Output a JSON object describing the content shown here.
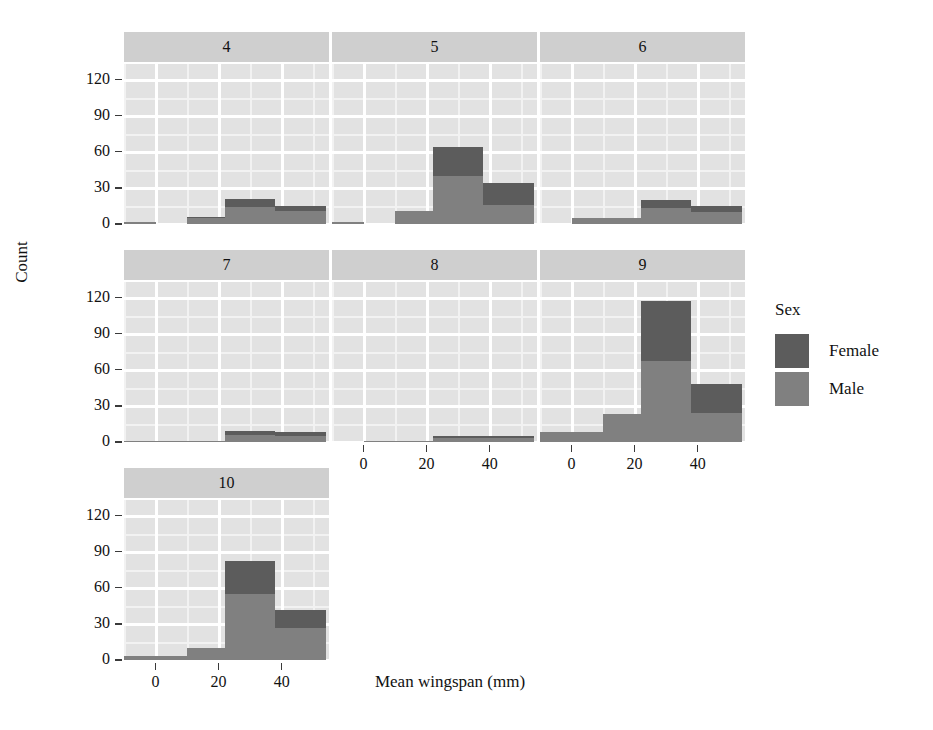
{
  "chart_data": {
    "type": "bar",
    "subtype": "stacked-histogram-facets",
    "title": "",
    "xlabel": "Mean wingspan (mm)",
    "ylabel": "Count",
    "xlim": [
      -10,
      55
    ],
    "ylim": [
      0,
      133
    ],
    "xticks": [
      0,
      20,
      40
    ],
    "yticks": [
      0,
      30,
      60,
      90,
      120
    ],
    "grid": true,
    "legend": {
      "title": "Sex",
      "position": "right",
      "entries": [
        {
          "name": "Female",
          "color": "#5c5c5c"
        },
        {
          "name": "Male",
          "color": "#808080"
        }
      ]
    },
    "facet_variable": "",
    "bin_edges": [
      -10,
      0,
      10,
      22,
      38,
      54
    ],
    "bin_centers": [
      -5,
      5,
      16,
      30,
      46
    ],
    "series": [
      {
        "name": "Female",
        "color": "#5c5c5c"
      },
      {
        "name": "Male",
        "color": "#808080"
      }
    ],
    "facets": [
      {
        "label": "4",
        "row": 0,
        "col": 0,
        "bins": [
          {
            "x0": -10,
            "x1": 0,
            "male": 2,
            "female": 0,
            "total": 2
          },
          {
            "x0": 0,
            "x1": 10,
            "male": 0,
            "female": 0,
            "total": 0
          },
          {
            "x0": 10,
            "x1": 22,
            "male": 5,
            "female": 1,
            "total": 6
          },
          {
            "x0": 22,
            "x1": 38,
            "male": 14,
            "female": 7,
            "total": 21
          },
          {
            "x0": 38,
            "x1": 54,
            "male": 11,
            "female": 4,
            "total": 15
          }
        ]
      },
      {
        "label": "5",
        "row": 0,
        "col": 1,
        "bins": [
          {
            "x0": -10,
            "x1": 0,
            "male": 2,
            "female": 0,
            "total": 2
          },
          {
            "x0": 0,
            "x1": 10,
            "male": 0,
            "female": 0,
            "total": 0
          },
          {
            "x0": 10,
            "x1": 22,
            "male": 11,
            "female": 0,
            "total": 11
          },
          {
            "x0": 22,
            "x1": 38,
            "male": 40,
            "female": 24,
            "total": 64
          },
          {
            "x0": 38,
            "x1": 54,
            "male": 16,
            "female": 18,
            "total": 34
          }
        ]
      },
      {
        "label": "6",
        "row": 0,
        "col": 2,
        "bins": [
          {
            "x0": -10,
            "x1": 0,
            "male": 0,
            "female": 0,
            "total": 0
          },
          {
            "x0": 0,
            "x1": 10,
            "male": 5,
            "female": 0,
            "total": 5
          },
          {
            "x0": 10,
            "x1": 22,
            "male": 5,
            "female": 0,
            "total": 5
          },
          {
            "x0": 22,
            "x1": 38,
            "male": 13,
            "female": 7,
            "total": 20
          },
          {
            "x0": 38,
            "x1": 54,
            "male": 10,
            "female": 5,
            "total": 15
          }
        ]
      },
      {
        "label": "7",
        "row": 1,
        "col": 0,
        "bins": [
          {
            "x0": -10,
            "x1": 0,
            "male": 1,
            "female": 0,
            "total": 1
          },
          {
            "x0": 0,
            "x1": 10,
            "male": 1,
            "female": 0,
            "total": 1
          },
          {
            "x0": 10,
            "x1": 22,
            "male": 1,
            "female": 0,
            "total": 1
          },
          {
            "x0": 22,
            "x1": 38,
            "male": 6,
            "female": 3,
            "total": 9
          },
          {
            "x0": 38,
            "x1": 54,
            "male": 5,
            "female": 3,
            "total": 8
          }
        ]
      },
      {
        "label": "8",
        "row": 1,
        "col": 1,
        "bins": [
          {
            "x0": -10,
            "x1": 0,
            "male": 0,
            "female": 0,
            "total": 0
          },
          {
            "x0": 0,
            "x1": 10,
            "male": 1,
            "female": 0,
            "total": 1
          },
          {
            "x0": 10,
            "x1": 22,
            "male": 1,
            "female": 0,
            "total": 1
          },
          {
            "x0": 22,
            "x1": 38,
            "male": 3,
            "female": 2,
            "total": 5
          },
          {
            "x0": 38,
            "x1": 54,
            "male": 3,
            "female": 2,
            "total": 5
          }
        ]
      },
      {
        "label": "9",
        "row": 1,
        "col": 2,
        "bins": [
          {
            "x0": -10,
            "x1": 0,
            "male": 8,
            "female": 0,
            "total": 8
          },
          {
            "x0": 0,
            "x1": 10,
            "male": 8,
            "female": 0,
            "total": 8
          },
          {
            "x0": 10,
            "x1": 22,
            "male": 23,
            "female": 0,
            "total": 23
          },
          {
            "x0": 22,
            "x1": 38,
            "male": 67,
            "female": 50,
            "total": 117
          },
          {
            "x0": 38,
            "x1": 54,
            "male": 24,
            "female": 24,
            "total": 48
          }
        ]
      },
      {
        "label": "10",
        "row": 2,
        "col": 0,
        "bins": [
          {
            "x0": -10,
            "x1": 0,
            "male": 3,
            "female": 0,
            "total": 3
          },
          {
            "x0": 0,
            "x1": 10,
            "male": 3,
            "female": 0,
            "total": 3
          },
          {
            "x0": 10,
            "x1": 22,
            "male": 10,
            "female": 0,
            "total": 10
          },
          {
            "x0": 22,
            "x1": 38,
            "male": 55,
            "female": 27,
            "total": 82
          },
          {
            "x0": 38,
            "x1": 54,
            "male": 27,
            "female": 15,
            "total": 42
          }
        ]
      }
    ]
  },
  "axes": {
    "y_title": "Count",
    "x_title": "Mean wingspan (mm)",
    "y_tick_labels": [
      "0",
      "30",
      "60",
      "90",
      "120"
    ],
    "x_tick_labels": [
      "0",
      "20",
      "40"
    ]
  },
  "legend": {
    "title": "Sex",
    "items": [
      {
        "label": "Female"
      },
      {
        "label": "Male"
      }
    ]
  },
  "facet_labels": [
    "4",
    "5",
    "6",
    "7",
    "8",
    "9",
    "10"
  ],
  "colors": {
    "female": "#5c5c5c",
    "male": "#808080",
    "panel_background": "#e2e2e2",
    "strip_background": "#cfcfcf",
    "grid_major": "#ffffff",
    "grid_minor": "#f2f2f2",
    "text": "#111111",
    "page_background": "#ffffff"
  }
}
